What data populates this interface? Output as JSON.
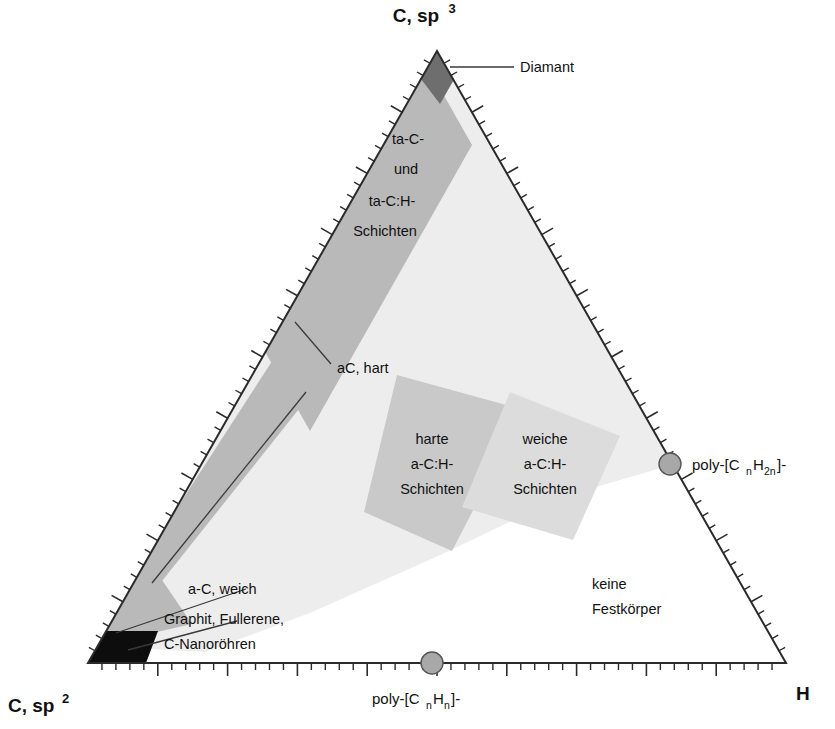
{
  "figure": {
    "kind": "ternary-phase-diagram",
    "title_visible": false,
    "background": "#ffffff"
  },
  "vertices": {
    "top": {
      "label": "C, sp",
      "superscript": "3",
      "name": "carbon-sp3"
    },
    "bottom_left": {
      "label": "C, sp",
      "superscript": "2",
      "name": "carbon-sp2"
    },
    "bottom_right": {
      "label": "H",
      "superscript": "",
      "name": "hydrogen"
    }
  },
  "axis_labels": {
    "bottom": {
      "prefix": "poly-[C",
      "sub1": "n",
      "mid": "H",
      "sub2": "n",
      "suffix": "]-"
    },
    "right": {
      "prefix": "poly-[C",
      "sub1": "n",
      "mid": "H",
      "sub2": "2n",
      "suffix": "]-"
    }
  },
  "regions": [
    {
      "name": "diamant",
      "label": "Diamant",
      "color": "#6e6e6e",
      "label_placement": "callout-right"
    },
    {
      "name": "ta-c-schichten",
      "label_lines": [
        "ta-C-",
        "und",
        "ta-C:H-",
        "Schichten"
      ],
      "color": "#b9b9b9"
    },
    {
      "name": "ac-hart",
      "label": "aC, hart",
      "color": "#b9b9b9",
      "label_placement": "callout"
    },
    {
      "name": "a-c-weich",
      "label": "a-C, weich",
      "color": "#b9b9b9",
      "label_placement": "callout"
    },
    {
      "name": "graphit-fullerene-nanoroehren",
      "label_lines": [
        "Graphit, Fullerene,",
        "C-Nanoröhren"
      ],
      "color": "#0d0d0d",
      "label_placement": "callout"
    },
    {
      "name": "harte-ach-schichten",
      "label_lines": [
        "harte",
        "a-C:H-",
        "Schichten"
      ],
      "color": "#c9c9c9"
    },
    {
      "name": "weiche-ach-schichten",
      "label_lines": [
        "weiche",
        "a-C:H-",
        "Schichten"
      ],
      "color": "#dcdcdc"
    },
    {
      "name": "keine-festkoerper",
      "label_lines": [
        "keine",
        "Festkörper"
      ],
      "color": "#ffffff"
    },
    {
      "name": "solid-field",
      "label": "",
      "color": "#ededed"
    }
  ],
  "markers": [
    {
      "name": "poly-cnhn-marker",
      "color": "#a8a8a8"
    },
    {
      "name": "poly-cnh2n-marker",
      "color": "#a8a8a8"
    }
  ],
  "ticks": {
    "minor_count": 50,
    "major_every": 5
  }
}
